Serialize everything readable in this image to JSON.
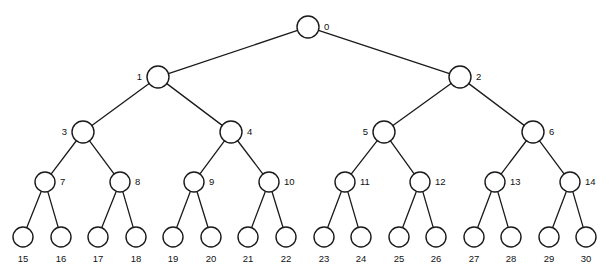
{
  "figure": {
    "width": 615,
    "height": 280,
    "background_color": "#ffffff",
    "stroke_color": "#1a1a1a",
    "node_fill_color": "#ffffff",
    "label_color": "#111111"
  },
  "tree": {
    "type": "binary-tree",
    "levels": 5,
    "node_count": 31,
    "root_id": "0",
    "nodes": [
      {
        "id": "0",
        "label": "0",
        "level": 0,
        "x": 308,
        "y": 27,
        "r": 11,
        "label_pos": "right",
        "parent": null
      },
      {
        "id": "1",
        "label": "1",
        "level": 1,
        "x": 158,
        "y": 77,
        "r": 11,
        "label_pos": "left",
        "parent": "0"
      },
      {
        "id": "2",
        "label": "2",
        "level": 1,
        "x": 460,
        "y": 77,
        "r": 11,
        "label_pos": "right",
        "parent": "0"
      },
      {
        "id": "3",
        "label": "3",
        "level": 2,
        "x": 83,
        "y": 132,
        "r": 11,
        "label_pos": "left",
        "parent": "1"
      },
      {
        "id": "4",
        "label": "4",
        "level": 2,
        "x": 231,
        "y": 132,
        "r": 11,
        "label_pos": "right",
        "parent": "1"
      },
      {
        "id": "5",
        "label": "5",
        "level": 2,
        "x": 384,
        "y": 132,
        "r": 11,
        "label_pos": "left",
        "parent": "2"
      },
      {
        "id": "6",
        "label": "6",
        "level": 2,
        "x": 533,
        "y": 132,
        "r": 11,
        "label_pos": "right",
        "parent": "2"
      },
      {
        "id": "7",
        "label": "7",
        "level": 3,
        "x": 45,
        "y": 182,
        "r": 10,
        "label_pos": "right",
        "parent": "3"
      },
      {
        "id": "8",
        "label": "8",
        "level": 3,
        "x": 120,
        "y": 182,
        "r": 10,
        "label_pos": "right",
        "parent": "3"
      },
      {
        "id": "9",
        "label": "9",
        "level": 3,
        "x": 194,
        "y": 182,
        "r": 10,
        "label_pos": "right",
        "parent": "4"
      },
      {
        "id": "10",
        "label": "10",
        "level": 3,
        "x": 269,
        "y": 182,
        "r": 10,
        "label_pos": "right",
        "parent": "4"
      },
      {
        "id": "11",
        "label": "11",
        "level": 3,
        "x": 345,
        "y": 182,
        "r": 10,
        "label_pos": "right",
        "parent": "5"
      },
      {
        "id": "12",
        "label": "12",
        "level": 3,
        "x": 420,
        "y": 182,
        "r": 10,
        "label_pos": "right",
        "parent": "5"
      },
      {
        "id": "13",
        "label": "13",
        "level": 3,
        "x": 495,
        "y": 182,
        "r": 10,
        "label_pos": "right",
        "parent": "6"
      },
      {
        "id": "14",
        "label": "14",
        "level": 3,
        "x": 570,
        "y": 182,
        "r": 10,
        "label_pos": "right",
        "parent": "6"
      },
      {
        "id": "15",
        "label": "15",
        "level": 4,
        "x": 23,
        "y": 237,
        "r": 10,
        "label_pos": "below",
        "parent": "7"
      },
      {
        "id": "16",
        "label": "16",
        "level": 4,
        "x": 61,
        "y": 237,
        "r": 10,
        "label_pos": "below",
        "parent": "7"
      },
      {
        "id": "17",
        "label": "17",
        "level": 4,
        "x": 98,
        "y": 237,
        "r": 10,
        "label_pos": "below",
        "parent": "8"
      },
      {
        "id": "18",
        "label": "18",
        "level": 4,
        "x": 136,
        "y": 237,
        "r": 10,
        "label_pos": "below",
        "parent": "8"
      },
      {
        "id": "19",
        "label": "19",
        "level": 4,
        "x": 173,
        "y": 237,
        "r": 10,
        "label_pos": "below",
        "parent": "9"
      },
      {
        "id": "20",
        "label": "20",
        "level": 4,
        "x": 211,
        "y": 237,
        "r": 10,
        "label_pos": "below",
        "parent": "9"
      },
      {
        "id": "21",
        "label": "21",
        "level": 4,
        "x": 248,
        "y": 237,
        "r": 10,
        "label_pos": "below",
        "parent": "10"
      },
      {
        "id": "22",
        "label": "22",
        "level": 4,
        "x": 286,
        "y": 237,
        "r": 10,
        "label_pos": "below",
        "parent": "10"
      },
      {
        "id": "23",
        "label": "23",
        "level": 4,
        "x": 324,
        "y": 237,
        "r": 10,
        "label_pos": "below",
        "parent": "11"
      },
      {
        "id": "24",
        "label": "24",
        "level": 4,
        "x": 361,
        "y": 237,
        "r": 10,
        "label_pos": "below",
        "parent": "11"
      },
      {
        "id": "25",
        "label": "25",
        "level": 4,
        "x": 399,
        "y": 237,
        "r": 10,
        "label_pos": "below",
        "parent": "12"
      },
      {
        "id": "26",
        "label": "26",
        "level": 4,
        "x": 436,
        "y": 237,
        "r": 10,
        "label_pos": "below",
        "parent": "12"
      },
      {
        "id": "27",
        "label": "27",
        "level": 4,
        "x": 474,
        "y": 237,
        "r": 10,
        "label_pos": "below",
        "parent": "13"
      },
      {
        "id": "28",
        "label": "28",
        "level": 4,
        "x": 511,
        "y": 237,
        "r": 10,
        "label_pos": "below",
        "parent": "13"
      },
      {
        "id": "29",
        "label": "29",
        "level": 4,
        "x": 549,
        "y": 237,
        "r": 10,
        "label_pos": "below",
        "parent": "14"
      },
      {
        "id": "30",
        "label": "30",
        "level": 4,
        "x": 586,
        "y": 237,
        "r": 10,
        "label_pos": "below",
        "parent": "14"
      }
    ],
    "edges": [
      {
        "from": "0",
        "to": "1"
      },
      {
        "from": "0",
        "to": "2"
      },
      {
        "from": "1",
        "to": "3"
      },
      {
        "from": "1",
        "to": "4"
      },
      {
        "from": "2",
        "to": "5"
      },
      {
        "from": "2",
        "to": "6"
      },
      {
        "from": "3",
        "to": "7"
      },
      {
        "from": "3",
        "to": "8"
      },
      {
        "from": "4",
        "to": "9"
      },
      {
        "from": "4",
        "to": "10"
      },
      {
        "from": "5",
        "to": "11"
      },
      {
        "from": "5",
        "to": "12"
      },
      {
        "from": "6",
        "to": "13"
      },
      {
        "from": "6",
        "to": "14"
      },
      {
        "from": "7",
        "to": "15"
      },
      {
        "from": "7",
        "to": "16"
      },
      {
        "from": "8",
        "to": "17"
      },
      {
        "from": "8",
        "to": "18"
      },
      {
        "from": "9",
        "to": "19"
      },
      {
        "from": "9",
        "to": "20"
      },
      {
        "from": "10",
        "to": "21"
      },
      {
        "from": "10",
        "to": "22"
      },
      {
        "from": "11",
        "to": "23"
      },
      {
        "from": "11",
        "to": "24"
      },
      {
        "from": "12",
        "to": "25"
      },
      {
        "from": "12",
        "to": "26"
      },
      {
        "from": "13",
        "to": "27"
      },
      {
        "from": "13",
        "to": "28"
      },
      {
        "from": "14",
        "to": "29"
      },
      {
        "from": "14",
        "to": "30"
      }
    ]
  }
}
